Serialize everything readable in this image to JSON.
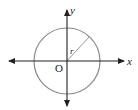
{
  "diagram": {
    "type": "circle-on-coordinate-axes",
    "labels": {
      "x_axis": "x",
      "y_axis": "y",
      "origin": "O",
      "radius": "r"
    },
    "colors": {
      "axes": "#222222",
      "circle": "#8a8a8a",
      "radius": "#8a8a8a",
      "background": "#ffffff"
    }
  }
}
